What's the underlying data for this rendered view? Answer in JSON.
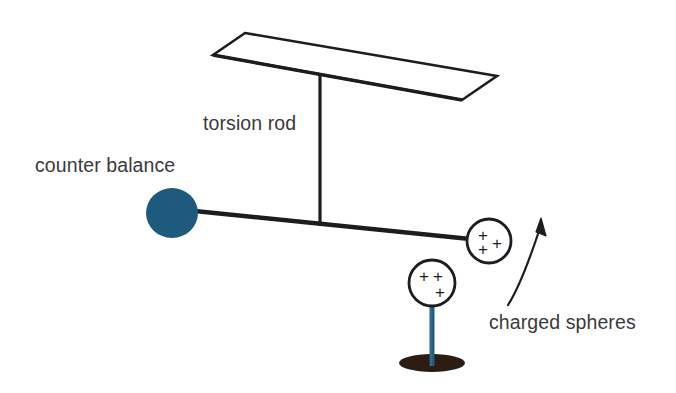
{
  "figure": {
    "type": "physics-diagram",
    "background_color": "#ffffff"
  },
  "labels": {
    "torsion_rod": "torsion rod",
    "counter_balance": "counter balance",
    "charged_spheres": "charged spheres"
  },
  "colors": {
    "ink": "#1d1d1f",
    "text": "#3a3a3c",
    "counter_balance_fill": "#1d5a7d",
    "post_fill": "#1f5f80",
    "base_fill": "#2b1d12"
  },
  "parts": {
    "ceiling_plate": {
      "name": "ceiling mount plate",
      "outline": "245,33 497,76 462,100 213,55"
    },
    "torsion_rod": {
      "name": "torsion rod",
      "x": 320,
      "y_top": 73,
      "y_bottom": 226
    },
    "beam": {
      "name": "horizontal balance beam",
      "x1": 175,
      "y1": 209,
      "x2": 478,
      "y2": 240
    },
    "counter_balance_sphere": {
      "cx": 172,
      "cy": 213,
      "rx": 26,
      "ry": 25
    },
    "charged_sphere_upper": {
      "cx": 489,
      "cy": 241,
      "r": 22,
      "charge_marks": 3,
      "charge_symbol": "+"
    },
    "charged_sphere_lower": {
      "cx": 432,
      "cy": 283,
      "r": 23,
      "charge_marks": 3,
      "charge_symbol": "+"
    },
    "support_post": {
      "x": 432,
      "y_top": 306,
      "y_bottom": 364
    },
    "base_disc": {
      "cx": 432,
      "cy": 363,
      "rx": 33,
      "ry": 9
    },
    "rotation_arrow": {
      "name": "rotation direction arrow",
      "path": "M 511,303 C 520,285 530,255 541,226",
      "head_at": "541,220"
    }
  },
  "charge_marks": {
    "upper_sphere": [
      {
        "x": 483,
        "y": 236
      },
      {
        "x": 497,
        "y": 244
      },
      {
        "x": 483,
        "y": 250
      }
    ],
    "lower_sphere": [
      {
        "x": 424,
        "y": 276
      },
      {
        "x": 438,
        "y": 276
      },
      {
        "x": 440,
        "y": 292
      }
    ]
  },
  "label_positions": {
    "torsion_rod": {
      "x": 203,
      "y": 130
    },
    "counter_balance": {
      "x": 35,
      "y": 172
    },
    "charged_spheres": {
      "x": 489,
      "y": 329
    }
  }
}
